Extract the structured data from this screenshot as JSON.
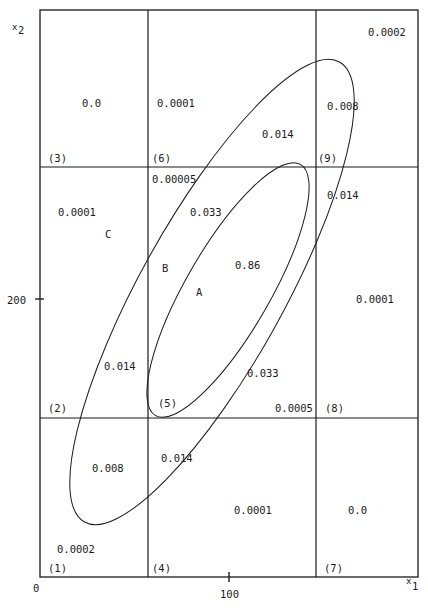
{
  "axes": {
    "x_label": "x",
    "x_sub": "1",
    "y_label": "x",
    "y_sub": "2",
    "origin": "0",
    "x_tick": "100",
    "y_tick": "200"
  },
  "cells": [
    {
      "id": "(1)",
      "value": "0.0002"
    },
    {
      "id": "(2)",
      "value": "0.014"
    },
    {
      "id": "(3)",
      "value": "0.0"
    },
    {
      "id": "(4)",
      "value": "0.014"
    },
    {
      "id": "(5)",
      "value": "0.86"
    },
    {
      "id": "(6)",
      "value": "0.0001"
    },
    {
      "id": "(7)",
      "value": "0.0"
    },
    {
      "id": "(8)",
      "value": "0.0001"
    },
    {
      "id": "(9)",
      "value": "0.008"
    }
  ],
  "labels": {
    "c1_prob": "0.0002",
    "c1_id": "(1)",
    "c1_in": "0.008",
    "c2_id": "(2)",
    "c2_in": "0.014",
    "c2_out": "0.0001",
    "c2_region": "C",
    "c3_id": "(3)",
    "c3_val": "0.0",
    "c4_id": "(4)",
    "c4_in": "0.014",
    "c4_out": "0.0001",
    "c5_id": "(5)",
    "c5_in": "0.86",
    "c5_mid_top": "0.033",
    "c5_mid_bot": "0.033",
    "c5_out_top": "0.00005",
    "c5_out_bot": "0.0005",
    "c5_region_a": "A",
    "c5_region_b": "B",
    "c6_id": "(6)",
    "c6_out": "0.0001",
    "c6_in": "0.014",
    "c7_id": "(7)",
    "c7_val": "0.0",
    "c8_id": "(8)",
    "c8_in": "0.014",
    "c8_out": "0.0001",
    "c9_id": "(9)",
    "c9_in": "0.008",
    "c9_out": "0.0002"
  },
  "colors": {
    "line": "#1a1a1a",
    "background": "#ffffff"
  }
}
